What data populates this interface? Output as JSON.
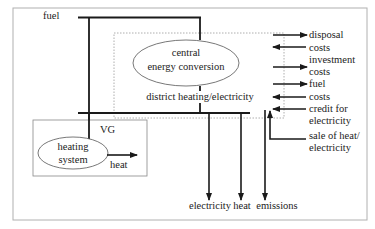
{
  "diagram": {
    "colors": {
      "line": "#1a1a1a",
      "frame": "#b0b0b0",
      "dotted": "#999999",
      "text": "#222222"
    },
    "inputs": {
      "fuel": "fuel"
    },
    "central": {
      "line1": "central",
      "line2": "energy conversion"
    },
    "network": {
      "label": "district heating/electricity"
    },
    "local": {
      "group_label": "VG",
      "heating_line1": "heating",
      "heating_line2": "system",
      "heat_output": "heat"
    },
    "outputs": {
      "electricity": "electricity",
      "heat": "heat",
      "emissions": "emissions"
    },
    "cost_flows": [
      {
        "direction": "out",
        "line1": "disposal",
        "line2": "costs"
      },
      {
        "direction": "in",
        "line1": "costs",
        "line2": ""
      },
      {
        "direction": "out",
        "line1": "investment",
        "line2": "costs"
      },
      {
        "direction": "out",
        "line1": "fuel",
        "line2": ""
      },
      {
        "direction": "in",
        "line1": "costs",
        "line2": ""
      },
      {
        "direction": "in",
        "line1": "credit for",
        "line2": "electricity"
      },
      {
        "direction": "in",
        "line1": "sale of heat/",
        "line2": "electricity"
      }
    ],
    "right_labels": {
      "l1": "disposal",
      "l2": "costs",
      "l3": "investment",
      "l4": "costs",
      "l5": "fuel",
      "l6": "costs",
      "l7": "credit for",
      "l8": "electricity",
      "l9": "sale of heat/",
      "l10": "electricity"
    }
  }
}
